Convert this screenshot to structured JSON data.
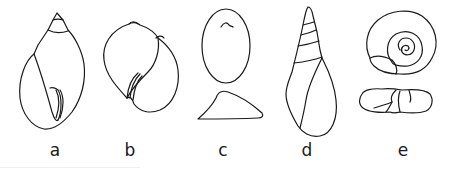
{
  "figure": {
    "stroke_color": "#1a1a1a",
    "background_color": "#ffffff",
    "panels": [
      {
        "id": "a",
        "label": "a",
        "shape": "ovate-conic spire, aperture view"
      },
      {
        "id": "b",
        "label": "b",
        "shape": "globose, aperture view"
      },
      {
        "id": "c",
        "label": "c",
        "shape": "limpet-like cap, top and side views"
      },
      {
        "id": "d",
        "label": "d",
        "shape": "turreted high spire, aperture view"
      },
      {
        "id": "e",
        "label": "e",
        "shape": "planispiral, top and side views"
      }
    ]
  }
}
